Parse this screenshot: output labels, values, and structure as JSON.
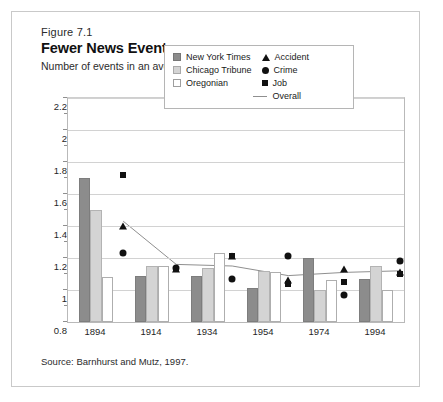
{
  "figure": {
    "number": "Figure 7.1",
    "title": "Fewer News Events",
    "subtitle": "Number of events in an average newspaper story.",
    "source": "Source: Barnhurst and Mutz, 1997."
  },
  "legend": {
    "bars": [
      {
        "key": "nyt",
        "label": "New York Times"
      },
      {
        "key": "ct",
        "label": "Chicago Tribune"
      },
      {
        "key": "or",
        "label": "Oregonian"
      }
    ],
    "markers": [
      {
        "key": "accident",
        "label": "Accident"
      },
      {
        "key": "crime",
        "label": "Crime"
      },
      {
        "key": "job",
        "label": "Job"
      }
    ],
    "line": {
      "key": "overall",
      "label": "Overall"
    }
  },
  "chart_data": {
    "type": "bar",
    "title": "Fewer News Events",
    "subtitle": "Number of events in an average newspaper story.",
    "xlabel": "",
    "ylabel": "",
    "categories": [
      "1894",
      "1914",
      "1934",
      "1954",
      "1974",
      "1994"
    ],
    "ylim": [
      0.8,
      2.2
    ],
    "yticks": [
      0.8,
      1,
      1.2,
      1.4,
      1.6,
      1.8,
      2,
      2.2
    ],
    "ytick_labels": [
      "0.8",
      "1",
      "1.2",
      "1.4",
      "1.6",
      "1.8",
      "2",
      "2.2"
    ],
    "grid": true,
    "legend_position": "inside-top-center",
    "series": [
      {
        "name": "New York Times",
        "type": "bar",
        "color": "#8c8c8c",
        "values": [
          1.7,
          1.09,
          1.09,
          1.01,
          1.2,
          1.07
        ]
      },
      {
        "name": "Chicago Tribune",
        "type": "bar",
        "color": "#d4d4d4",
        "values": [
          1.5,
          1.15,
          1.14,
          1.12,
          1.0,
          1.15
        ]
      },
      {
        "name": "Oregonian",
        "type": "bar",
        "color": "#ffffff",
        "values": [
          1.08,
          1.15,
          1.23,
          1.11,
          1.06,
          1.0
        ]
      },
      {
        "name": "Accident",
        "type": "marker",
        "marker": "triangle",
        "color": "#111111",
        "values": [
          1.4,
          1.13,
          1.21,
          1.06,
          1.13,
          1.11
        ]
      },
      {
        "name": "Crime",
        "type": "marker",
        "marker": "circle",
        "color": "#111111",
        "values": [
          1.23,
          1.14,
          1.07,
          1.21,
          0.97,
          1.18
        ]
      },
      {
        "name": "Job",
        "type": "marker",
        "marker": "square",
        "color": "#111111",
        "values": [
          1.72,
          1.13,
          1.21,
          1.04,
          1.05,
          1.1
        ]
      },
      {
        "name": "Overall",
        "type": "line",
        "color": "#8f8f8f",
        "values": [
          1.43,
          1.16,
          1.15,
          1.09,
          1.11,
          1.12
        ]
      }
    ]
  }
}
